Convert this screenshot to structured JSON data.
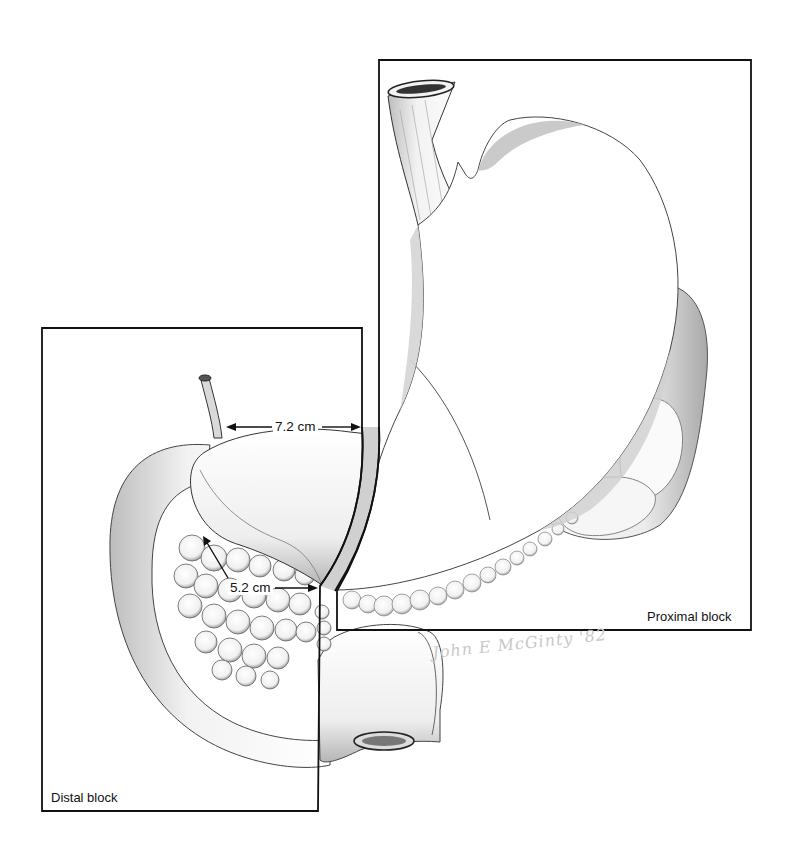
{
  "figure": {
    "type": "anatomical illustration",
    "colors": {
      "background": "#ffffff",
      "line": "#111111",
      "shading": "#9a9a9a",
      "signature": "#c8c8c8"
    }
  },
  "blocks": {
    "proximal": {
      "label": "Proximal block"
    },
    "distal": {
      "label": "Distal block"
    }
  },
  "measurements": [
    {
      "id": "upper",
      "label": "7.2 cm"
    },
    {
      "id": "lower",
      "label": "5.2 cm"
    }
  ],
  "signature": {
    "text": "John E McGinty '82"
  }
}
